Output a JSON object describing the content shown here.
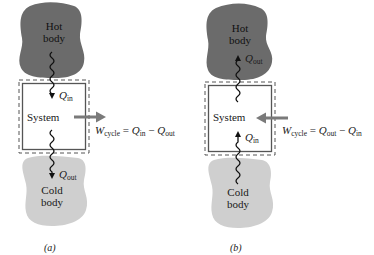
{
  "colors": {
    "hot_body": "#6b6b6b",
    "cold_body": "#cfcfcf",
    "work_arrow": "#7a7a7a",
    "box_border": "#555555",
    "heat_line": "#111111"
  },
  "panels": [
    {
      "id": "a",
      "label": "(a)",
      "hot_body": {
        "line1": "Hot",
        "line2": "body"
      },
      "cold_body": {
        "line1": "Cold",
        "line2": "body"
      },
      "system_label": "System",
      "heat_top": {
        "symbol": "Q",
        "sub": "in",
        "direction": "down"
      },
      "heat_bottom": {
        "symbol": "Q",
        "sub": "out",
        "direction": "down"
      },
      "work_arrow_direction": "out",
      "equation": {
        "lhs": "W",
        "lhs_sub": "cycle",
        "op1": " = ",
        "t1": "Q",
        "t1_sub": "in",
        "op2": " − ",
        "t2": "Q",
        "t2_sub": "out"
      }
    },
    {
      "id": "b",
      "label": "(b)",
      "hot_body": {
        "line1": "Hot",
        "line2": "body"
      },
      "cold_body": {
        "line1": "Cold",
        "line2": "body"
      },
      "system_label": "System",
      "heat_top": {
        "symbol": "Q",
        "sub": "out",
        "direction": "up"
      },
      "heat_bottom": {
        "symbol": "Q",
        "sub": "in",
        "direction": "up"
      },
      "work_arrow_direction": "in",
      "equation": {
        "lhs": "W",
        "lhs_sub": "cycle",
        "op1": " = ",
        "t1": "Q",
        "t1_sub": "out",
        "op2": " − ",
        "t2": "Q",
        "t2_sub": "in"
      }
    }
  ]
}
